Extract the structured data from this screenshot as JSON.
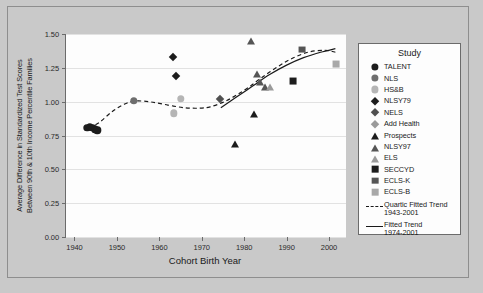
{
  "chart_data": {
    "type": "scatter",
    "title": "",
    "xlabel": "Cohort Birth Year",
    "ylabel": "Average Difference in Standardized Test Scores\nBetween 90th & 10th Income Percentile Families",
    "ylabel_line1": "Average Difference in Standardized Test Scores",
    "ylabel_line2": "Between 90th & 10th Income Percentile Families",
    "xlim": [
      1938,
      2004
    ],
    "ylim": [
      0.0,
      1.5
    ],
    "xticks": [
      "1940",
      "1950",
      "1960",
      "1970",
      "1980",
      "1990",
      "2000"
    ],
    "xtick_values": [
      1940,
      1950,
      1960,
      1970,
      1980,
      1990,
      2000
    ],
    "yticks": [
      "0.00",
      "0.25",
      "0.50",
      "0.75",
      "1.00",
      "1.25",
      "1.50"
    ],
    "ytick_values": [
      0.0,
      0.25,
      0.5,
      0.75,
      1.0,
      1.25,
      1.5
    ],
    "grid": true,
    "legend_position": "right",
    "legend_title": "Study",
    "series": [
      {
        "name": "TALENT",
        "marker": "circle",
        "color": "#1c1c1c",
        "points": [
          {
            "x": 1943.0,
            "y": 0.805
          },
          {
            "x": 1943.6,
            "y": 0.812
          },
          {
            "x": 1944.2,
            "y": 0.808
          },
          {
            "x": 1944.8,
            "y": 0.795
          },
          {
            "x": 1945.4,
            "y": 0.788
          }
        ]
      },
      {
        "name": "NLS",
        "marker": "circle",
        "color": "#6e6e6e",
        "points": [
          {
            "x": 1954.0,
            "y": 1.005
          }
        ]
      },
      {
        "name": "HS&B",
        "marker": "circle",
        "color": "#b5b5b5",
        "points": [
          {
            "x": 1963.4,
            "y": 0.915
          },
          {
            "x": 1965.0,
            "y": 1.02
          }
        ]
      },
      {
        "name": "NLSY79",
        "marker": "diamond",
        "color": "#1c1c1c",
        "points": [
          {
            "x": 1963.3,
            "y": 1.33
          },
          {
            "x": 1964.0,
            "y": 1.19
          }
        ]
      },
      {
        "name": "NELS",
        "marker": "diamond",
        "color": "#505050",
        "points": [
          {
            "x": 1974.3,
            "y": 1.02
          }
        ]
      },
      {
        "name": "Add Health",
        "marker": "diamond",
        "color": "#9a9a9a",
        "points": []
      },
      {
        "name": "Prospects",
        "marker": "triangle",
        "color": "#1c1c1c",
        "points": [
          {
            "x": 1977.8,
            "y": 0.695
          },
          {
            "x": 1982.2,
            "y": 0.92
          }
        ]
      },
      {
        "name": "NLSY97",
        "marker": "triangle",
        "color": "#555555",
        "points": [
          {
            "x": 1981.5,
            "y": 1.455
          },
          {
            "x": 1983.0,
            "y": 1.215
          },
          {
            "x": 1983.8,
            "y": 1.155
          },
          {
            "x": 1984.8,
            "y": 1.12
          }
        ]
      },
      {
        "name": "ELS",
        "marker": "triangle",
        "color": "#9a9a9a",
        "points": [
          {
            "x": 1986.2,
            "y": 1.115
          }
        ]
      },
      {
        "name": "SECCYD",
        "marker": "square",
        "color": "#1c1c1c",
        "points": [
          {
            "x": 1991.5,
            "y": 1.15
          }
        ]
      },
      {
        "name": "ECLS-K",
        "marker": "square",
        "color": "#555555",
        "points": [
          {
            "x": 1993.7,
            "y": 1.385
          }
        ]
      },
      {
        "name": "ECLS-B",
        "marker": "square",
        "color": "#a8a8a8",
        "points": [
          {
            "x": 2001.6,
            "y": 1.275
          }
        ]
      }
    ],
    "trends": [
      {
        "name": "Quartic Fitted Trend",
        "range_label": "1943-2001",
        "style": "dashed",
        "color": "#1a1a1a",
        "points": [
          {
            "x": 1943.5,
            "y": 0.805
          },
          {
            "x": 1946.0,
            "y": 0.85
          },
          {
            "x": 1949.0,
            "y": 0.93
          },
          {
            "x": 1952.0,
            "y": 0.985
          },
          {
            "x": 1954.5,
            "y": 1.005
          },
          {
            "x": 1958.0,
            "y": 0.998
          },
          {
            "x": 1962.0,
            "y": 0.975
          },
          {
            "x": 1966.0,
            "y": 0.955
          },
          {
            "x": 1969.5,
            "y": 0.952
          },
          {
            "x": 1972.0,
            "y": 0.962
          },
          {
            "x": 1975.0,
            "y": 0.995
          },
          {
            "x": 1978.0,
            "y": 1.045
          },
          {
            "x": 1981.0,
            "y": 1.105
          },
          {
            "x": 1984.0,
            "y": 1.175
          },
          {
            "x": 1987.5,
            "y": 1.25
          },
          {
            "x": 1991.0,
            "y": 1.315
          },
          {
            "x": 1995.0,
            "y": 1.365
          },
          {
            "x": 1999.0,
            "y": 1.38
          },
          {
            "x": 2001.5,
            "y": 1.365
          }
        ]
      },
      {
        "name": "Fitted Trend",
        "range_label": "1974-2001",
        "style": "solid",
        "color": "#1a1a1a",
        "points": [
          {
            "x": 1974.5,
            "y": 0.955
          },
          {
            "x": 1978.0,
            "y": 1.03
          },
          {
            "x": 1982.0,
            "y": 1.115
          },
          {
            "x": 1986.0,
            "y": 1.2
          },
          {
            "x": 1990.0,
            "y": 1.27
          },
          {
            "x": 1994.0,
            "y": 1.325
          },
          {
            "x": 1998.0,
            "y": 1.365
          },
          {
            "x": 2001.5,
            "y": 1.392
          }
        ]
      }
    ]
  },
  "legend": {
    "title": "Study",
    "entries": [
      {
        "label": "TALENT",
        "marker": "circle",
        "color": "#1c1c1c"
      },
      {
        "label": "NLS",
        "marker": "circle",
        "color": "#6e6e6e"
      },
      {
        "label": "HS&B",
        "marker": "circle",
        "color": "#b5b5b5"
      },
      {
        "label": "NLSY79",
        "marker": "diamond",
        "color": "#1c1c1c"
      },
      {
        "label": "NELS",
        "marker": "diamond",
        "color": "#505050"
      },
      {
        "label": "Add Health",
        "marker": "diamond",
        "color": "#9a9a9a"
      },
      {
        "label": "Prospects",
        "marker": "triangle",
        "color": "#1c1c1c"
      },
      {
        "label": "NLSY97",
        "marker": "triangle",
        "color": "#555555"
      },
      {
        "label": "ELS",
        "marker": "triangle",
        "color": "#9a9a9a"
      },
      {
        "label": "SECCYD",
        "marker": "square",
        "color": "#1c1c1c"
      },
      {
        "label": "ECLS-K",
        "marker": "square",
        "color": "#555555"
      },
      {
        "label": "ECLS-B",
        "marker": "square",
        "color": "#a8a8a8"
      }
    ],
    "line_entries": [
      {
        "name": "Quartic Fitted Trend",
        "range_label": "1943-2001",
        "style": "dashed"
      },
      {
        "name": "Fitted Trend",
        "range_label": "1974-2001",
        "style": "solid"
      }
    ]
  },
  "colors": {
    "background": "#c9c9c9",
    "plot_background": "#fdfdfd",
    "axis": "#6b6b6b",
    "grid": "#e2e2e2",
    "text": "#1a1a1a"
  }
}
